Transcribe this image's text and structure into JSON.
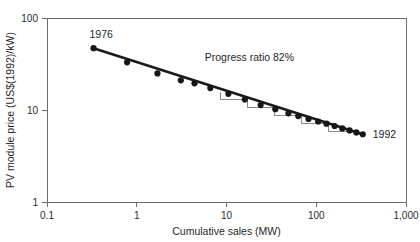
{
  "chart_data": {
    "type": "scatter",
    "title": "",
    "xlabel": "Cumulative sales (MW)",
    "ylabel": "PV module price (US$(1992)/kW)",
    "xscale": "log",
    "yscale": "log",
    "xlim": [
      0.1,
      1000
    ],
    "ylim": [
      1,
      100
    ],
    "xticks": [
      0.1,
      1,
      10,
      100,
      1000
    ],
    "xticklabels": [
      "0.1",
      "1",
      "10",
      "100",
      "1,000"
    ],
    "yticks": [
      1,
      10,
      100
    ],
    "yticklabels": [
      "1",
      "10",
      "100"
    ],
    "grid": false,
    "legend": null,
    "series": [
      {
        "name": "PV module price",
        "x": [
          0.33,
          0.78,
          1.7,
          3.1,
          4.4,
          6.6,
          10.5,
          16.0,
          24.0,
          35.0,
          49.0,
          63.0,
          82.0,
          105.0,
          130.0,
          160.0,
          195.0,
          235.0,
          280.0,
          330.0
        ],
        "y": [
          47.0,
          33.0,
          25.0,
          21.0,
          19.5,
          17.3,
          15.0,
          13.0,
          11.3,
          10.2,
          9.2,
          8.6,
          8.0,
          7.5,
          7.1,
          6.7,
          6.3,
          6.0,
          5.7,
          5.45
        ]
      }
    ],
    "fit_line": {
      "name": "experience curve fit",
      "x": [
        0.33,
        330.0
      ],
      "y": [
        47.0,
        5.45
      ]
    },
    "annotations": [
      {
        "name": "start-year-label",
        "text": "1976",
        "x": 0.33,
        "y": 47.0
      },
      {
        "name": "end-year-label",
        "text": "1992",
        "x": 330.0,
        "y": 5.45
      },
      {
        "name": "progress-ratio-label",
        "text": "Progress ratio 82%",
        "x": 18.0,
        "y": 34.0
      }
    ],
    "staircase": {
      "name": "progress-ratio-steps",
      "description": "step polylines showing 82% price reduction per doubling of cumulative sales",
      "doubling_steps": [
        {
          "x_start": 8.5,
          "x_end": 17.0,
          "y_start": 15.8,
          "y_end": 13.0
        },
        {
          "x_start": 17.0,
          "x_end": 34.0,
          "y_start": 13.0,
          "y_end": 10.7
        },
        {
          "x_start": 34.0,
          "x_end": 68.0,
          "y_start": 10.7,
          "y_end": 8.8
        },
        {
          "x_start": 68.0,
          "x_end": 136.0,
          "y_start": 8.8,
          "y_end": 7.2
        },
        {
          "x_start": 136.0,
          "x_end": 272.0,
          "y_start": 7.2,
          "y_end": 5.9
        }
      ]
    }
  },
  "axes": {
    "x_title": "Cumulative sales (MW)",
    "y_title": "PV module price (US$(1992)/kW)",
    "x_tick_labels": [
      "0.1",
      "1",
      "10",
      "100",
      "1,000"
    ],
    "y_tick_labels": [
      "100",
      "10",
      "1"
    ]
  },
  "labels": {
    "start_year": "1976",
    "end_year": "1992",
    "progress_ratio": "Progress ratio 82%"
  },
  "colors": {
    "marker": "#161616",
    "trend": "#1a1a1a",
    "axis": "#6d6d6d",
    "step": "#8a8a8a",
    "text": "#1f1f1f",
    "background": "#ffffff"
  }
}
